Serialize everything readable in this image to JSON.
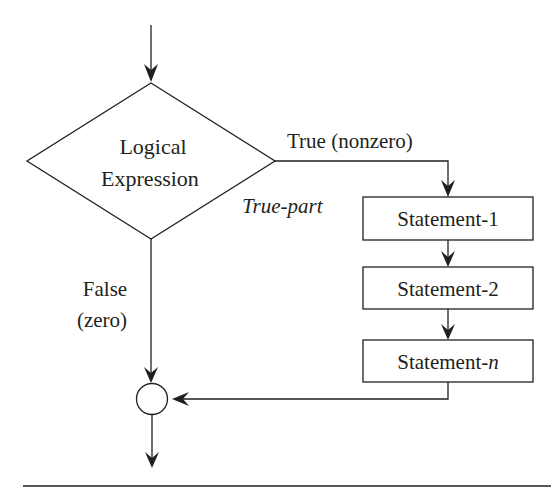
{
  "diagram": {
    "type": "flowchart",
    "colors": {
      "line": "#231f20",
      "background": "#ffffff"
    },
    "decision": {
      "line1": "Logical",
      "line2": "Expression"
    },
    "branches": {
      "true_label": "True (nonzero)",
      "true_part_label": "True-part",
      "false_label_line1": "False",
      "false_label_line2": "(zero)"
    },
    "statements": [
      {
        "prefix": "Statement-",
        "suffix": "1",
        "suffix_italic": false
      },
      {
        "prefix": "Statement-",
        "suffix": "2",
        "suffix_italic": false
      },
      {
        "prefix": "Statement-",
        "suffix": "n",
        "suffix_italic": true
      }
    ],
    "junction": "connector-circle"
  }
}
